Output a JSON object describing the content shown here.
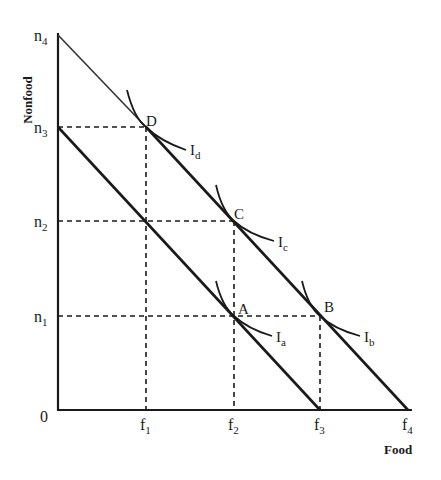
{
  "diagram": {
    "x_axis_title": "Food",
    "y_axis_title": "Nonfood",
    "origin_label": "0",
    "x_ticks": [
      {
        "base": "f",
        "sub": "1"
      },
      {
        "base": "f",
        "sub": "2"
      },
      {
        "base": "f",
        "sub": "3"
      },
      {
        "base": "f",
        "sub": "4"
      }
    ],
    "y_ticks": [
      {
        "base": "n",
        "sub": "1"
      },
      {
        "base": "n",
        "sub": "2"
      },
      {
        "base": "n",
        "sub": "3"
      },
      {
        "base": "n",
        "sub": "4"
      }
    ],
    "points": [
      {
        "label": "A",
        "x": "f2",
        "y": "n1"
      },
      {
        "label": "B",
        "x": "f3",
        "y": "n1"
      },
      {
        "label": "C",
        "x": "f2",
        "y": "n2"
      },
      {
        "label": "D",
        "x": "f1",
        "y": "n3"
      }
    ],
    "indifference_curves": [
      {
        "base": "I",
        "sub": "a",
        "through": "A"
      },
      {
        "base": "I",
        "sub": "b",
        "through": "B"
      },
      {
        "base": "I",
        "sub": "c",
        "through": "C"
      },
      {
        "base": "I",
        "sub": "d",
        "through": "D"
      }
    ],
    "budget_lines": [
      {
        "name": "inner",
        "from": "n3",
        "to": "f3"
      },
      {
        "name": "outer",
        "from": "n4",
        "to": "f4",
        "upper_segment_style": "thin",
        "upper_segment_range": "n4 to D"
      }
    ],
    "colors": {
      "ink": "#1a1a1a",
      "background": "#ffffff"
    }
  }
}
